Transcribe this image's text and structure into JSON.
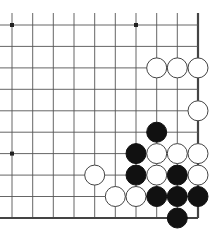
{
  "board": {
    "description": "Go board fragment (lower-right corner)",
    "columns_x": [
      12,
      32.7,
      53.3,
      74,
      94.7,
      115.3,
      136,
      156.7,
      177.3,
      198
    ],
    "rows_y": [
      25,
      46.4,
      67.9,
      89.3,
      110.8,
      132.2,
      153.6,
      175.1,
      196.5,
      218
    ],
    "edge_right_col": 9,
    "edge_bottom_row": 9,
    "line_color": "#555555",
    "edge_color": "#444444",
    "hoshi": [
      [
        0,
        0
      ],
      [
        6,
        0
      ],
      [
        0,
        6
      ]
    ],
    "stone_radius": 10,
    "stones": [
      {
        "color": "white",
        "col": 7,
        "row": 2
      },
      {
        "color": "white",
        "col": 8,
        "row": 2
      },
      {
        "color": "white",
        "col": 9,
        "row": 2
      },
      {
        "color": "white",
        "col": 9,
        "row": 4
      },
      {
        "color": "black",
        "col": 7,
        "row": 5
      },
      {
        "color": "black",
        "col": 6,
        "row": 6
      },
      {
        "color": "white",
        "col": 7,
        "row": 6
      },
      {
        "color": "white",
        "col": 8,
        "row": 6
      },
      {
        "color": "white",
        "col": 9,
        "row": 6
      },
      {
        "color": "white",
        "col": 4,
        "row": 7
      },
      {
        "color": "black",
        "col": 6,
        "row": 7
      },
      {
        "color": "white",
        "col": 7,
        "row": 7
      },
      {
        "color": "black",
        "col": 8,
        "row": 7
      },
      {
        "color": "white",
        "col": 9,
        "row": 7
      },
      {
        "color": "white",
        "col": 5,
        "row": 8
      },
      {
        "color": "white",
        "col": 6,
        "row": 8
      },
      {
        "color": "black",
        "col": 7,
        "row": 8
      },
      {
        "color": "black",
        "col": 8,
        "row": 8
      },
      {
        "color": "black",
        "col": 9,
        "row": 8
      },
      {
        "color": "black",
        "col": 8,
        "row": 9
      }
    ]
  }
}
